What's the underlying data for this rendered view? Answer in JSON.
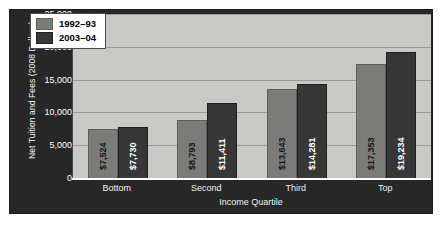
{
  "chart_data": {
    "type": "bar",
    "title": "",
    "xlabel": "Income Quartile",
    "ylabel": "Net Tuition and Fees (2008 Dollars)",
    "categories": [
      "Bottom",
      "Second",
      "Third",
      "Top"
    ],
    "series": [
      {
        "name": "1992–93",
        "color": "#7b7b79",
        "values": [
          7524,
          8793,
          13643,
          17353
        ],
        "labels": [
          "$7,524",
          "$8,793",
          "$13,643",
          "$17,353"
        ]
      },
      {
        "name": "2003–04",
        "color": "#373737",
        "values": [
          7730,
          11411,
          14281,
          19234
        ],
        "labels": [
          "$7,730",
          "$11,411",
          "$14,281",
          "$19,234"
        ]
      }
    ],
    "ylim": [
      0,
      25000
    ],
    "yticks": [
      0,
      5000,
      10000,
      15000,
      20000,
      25000
    ],
    "ytick_labels": [
      "0",
      "5,000",
      "10,000",
      "15,000",
      "20,000",
      "25,000"
    ],
    "grid": true,
    "legend_position": "upper left",
    "plot_background": "#c9c9c6",
    "panel_background": "#272727"
  }
}
